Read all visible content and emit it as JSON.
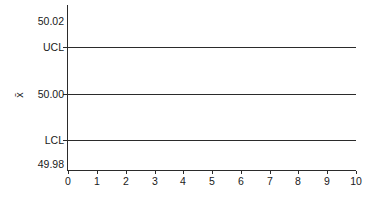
{
  "chart_data": {
    "type": "line",
    "title": "",
    "subtitle": "",
    "xlabel": "",
    "ylabel": "x̄",
    "xlim": [
      0,
      10
    ],
    "ylim": [
      49.98,
      50.02
    ],
    "grid": false,
    "legend": null,
    "x_ticks": [
      "0",
      "1",
      "2",
      "3",
      "4",
      "5",
      "6",
      "7",
      "8",
      "9",
      "10"
    ],
    "x_tick_values": [
      0,
      1,
      2,
      3,
      4,
      5,
      6,
      7,
      8,
      9,
      10
    ],
    "y_ticks": [
      "50.02",
      "UCL",
      "50.00",
      "LCL",
      "49.98"
    ],
    "y_tick_values": [
      50.02,
      50.015,
      50.0,
      49.985,
      49.98
    ],
    "series": [
      {
        "name": "UCL",
        "kind": "control-limit",
        "value": 50.015,
        "label": "UCL",
        "x": [
          0,
          10
        ],
        "values": [
          50.015,
          50.015
        ],
        "color": "#2b2b2b"
      },
      {
        "name": "Center Line",
        "kind": "center-line",
        "value": 50.0,
        "label": "50.00",
        "x": [
          0,
          10
        ],
        "values": [
          50.0,
          50.0
        ],
        "color": "#2b2b2b"
      },
      {
        "name": "LCL",
        "kind": "control-limit",
        "value": 49.985,
        "label": "LCL",
        "x": [
          0,
          10
        ],
        "values": [
          49.985,
          49.985
        ],
        "color": "#2b2b2b"
      }
    ],
    "data_points": []
  },
  "axes": {
    "y_axis_title": "x̄",
    "y_labels": [
      {
        "text": "50.02",
        "top": 16
      },
      {
        "text": "UCL",
        "top": 42
      },
      {
        "text": "50.00",
        "top": 89
      },
      {
        "text": "LCL",
        "top": 135
      },
      {
        "text": "49.98",
        "top": 159
      }
    ],
    "y_tick_marks": [
      47,
      94,
      140
    ],
    "control_lines": [
      {
        "name": "ucl-line",
        "top": 47
      },
      {
        "name": "center-line",
        "top": 94
      },
      {
        "name": "lcl-line",
        "top": 140
      }
    ],
    "x_labels": [
      {
        "text": "0",
        "left": 68
      },
      {
        "text": "1",
        "left": 97
      },
      {
        "text": "2",
        "left": 126
      },
      {
        "text": "3",
        "left": 155
      },
      {
        "text": "4",
        "left": 183
      },
      {
        "text": "5",
        "left": 212
      },
      {
        "text": "6",
        "left": 241
      },
      {
        "text": "7",
        "left": 270
      },
      {
        "text": "8",
        "left": 298
      },
      {
        "text": "9",
        "left": 327
      },
      {
        "text": "10",
        "left": 356
      }
    ]
  },
  "colors": {
    "line": "#2b2b2b",
    "axis": "#2b2b2b",
    "text": "#1a1a1a",
    "background": "#ffffff"
  }
}
